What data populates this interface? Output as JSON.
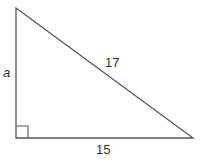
{
  "diagram": {
    "type": "right-triangle",
    "stroke_color": "#555555",
    "text_color": "#333333",
    "labels": {
      "vertical_leg": "a",
      "hypotenuse": "17",
      "horizontal_leg": "15"
    },
    "right_angle_marker": true
  }
}
